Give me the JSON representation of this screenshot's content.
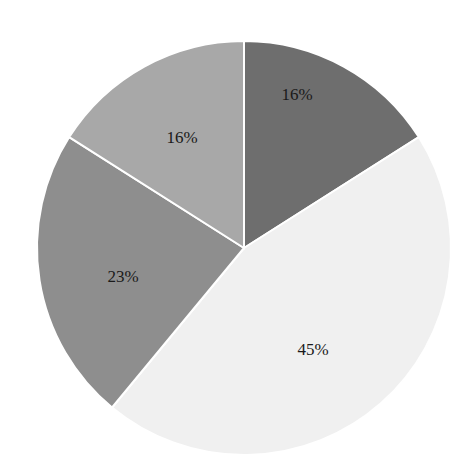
{
  "chart_data": {
    "type": "pie",
    "title": "",
    "start_angle_deg": 0,
    "direction": "clockwise",
    "center": [
      244,
      248
    ],
    "radius": 207,
    "slices": [
      {
        "label": "16%",
        "value": 16,
        "color": "#6e6e6e",
        "label_pos": [
          297,
          100
        ]
      },
      {
        "label": "45%",
        "value": 45,
        "color": "#f0f0f0",
        "label_pos": [
          313,
          355
        ]
      },
      {
        "label": "23%",
        "value": 23,
        "color": "#8e8e8e",
        "label_pos": [
          123,
          282
        ]
      },
      {
        "label": "16%",
        "value": 16,
        "color": "#a8a8a8",
        "label_pos": [
          182,
          143
        ]
      }
    ],
    "separator_color": "#ffffff",
    "legend": "none"
  }
}
